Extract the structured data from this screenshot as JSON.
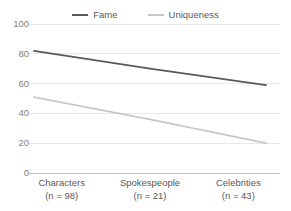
{
  "chart_data": {
    "type": "line",
    "title": "",
    "subtitle": "",
    "xlabel": "",
    "ylabel": "",
    "categories": [
      "Characters",
      "Spokespeople",
      "Celebrities"
    ],
    "category_sublabels": [
      "(n = 98)",
      "(n = 21)",
      "(n = 43)"
    ],
    "x_tick_labels": [
      {
        "name": "Characters",
        "sub": "(n = 98)"
      },
      {
        "name": "Spokespeople",
        "sub": "(n = 21)"
      },
      {
        "name": "Celebrities",
        "sub": "(n = 43)"
      }
    ],
    "series": [
      {
        "name": "Fame",
        "color": "#595959",
        "values": [
          82,
          70,
          59
        ]
      },
      {
        "name": "Uniqueness",
        "color": "#c8c8c8",
        "values": [
          51,
          36,
          20
        ]
      }
    ],
    "ylim": [
      0,
      100
    ],
    "y_ticks": [
      0,
      20,
      40,
      60,
      80,
      100
    ],
    "y_tick_labels": [
      "0",
      "20",
      "40",
      "60",
      "80",
      "100"
    ],
    "grid": true,
    "grid_color": "#e8e8e8",
    "axis_color": "#bfbfbf",
    "legend": {
      "position": "top-center",
      "entries": [
        {
          "label": "Fame",
          "color": "#595959"
        },
        {
          "label": "Uniqueness",
          "color": "#c8c8c8"
        }
      ]
    }
  },
  "colors": {
    "background": "#ffffff",
    "fame": "#595959",
    "uniqueness": "#c8c8c8",
    "gridline": "#e8e8e8",
    "tick_text": "#808080",
    "label_text": "#595959"
  }
}
